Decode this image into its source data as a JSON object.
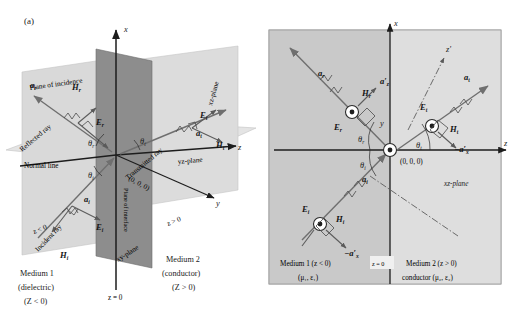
{
  "figure": {
    "caption_a": "(a)",
    "caption_b": "(b)"
  },
  "panel_a": {
    "axes": {
      "x": "x",
      "y": "y",
      "z": "z"
    },
    "planes": {
      "plane_of_incidence": "Plane of incidence",
      "xz_plane": "xz-plane",
      "yz_plane": "yz-plane",
      "xy_plane": "xy-plane",
      "plane_of_interface": "Plane of interface",
      "normal_line": "Normal line"
    },
    "rays": {
      "reflected": "Reflected ray",
      "transmitted": "Transmitted ray",
      "incident": "Incident ray"
    },
    "vectors": {
      "a_r": "a",
      "a_r_sub": "r",
      "a_t": "a",
      "a_t_sub": "t",
      "a_i": "a",
      "a_i_sub": "i",
      "E_r": "E",
      "E_r_sub": "r",
      "E_t": "E",
      "E_t_sub": "t",
      "E_i": "E",
      "E_i_sub": "i",
      "H_r": "H",
      "H_r_sub": "r",
      "H_t": "H",
      "H_t_sub": "t",
      "H_i": "H",
      "H_i_sub": "i"
    },
    "angles": {
      "theta_r": "θ",
      "theta_r_sub": "r",
      "theta_i": "θ",
      "theta_i_sub": "i",
      "theta_t": "θ",
      "theta_t_sub": "t"
    },
    "origin": "(0, 0, 0)",
    "regions": {
      "z_neg": "z < 0",
      "z_pos": "z > 0",
      "z_zero": "z = 0",
      "medium1_line1": "Medium 1",
      "medium1_line2": "(dielectric)",
      "medium1_line3": "(Z < 0)",
      "medium2_line1": "Medium 2",
      "medium2_line2": "(conductor)",
      "medium2_line3": "(Z > 0)"
    }
  },
  "panel_b": {
    "axes": {
      "x": "x",
      "y": "y",
      "z": "z",
      "z_prime": "z'"
    },
    "origin": "(0, 0, 0)",
    "plane_label": "xz-plane",
    "interface_label": "z = 0",
    "vectors": {
      "a_r": "a",
      "a_r_sub": "r",
      "a_t": "a",
      "a_t_sub": "t",
      "a_i": "a",
      "a_i_sub": "i",
      "E_r": "E",
      "E_r_sub": "r",
      "E_t": "E",
      "E_t_sub": "t",
      "E_i": "E",
      "E_i_sub": "i",
      "H_r": "H",
      "H_r_sub": "r",
      "H_t": "H",
      "H_t_sub": "t",
      "H_i": "H",
      "H_i_sub": "i",
      "a_prime_z": "a′",
      "a_prime_z_sub": "z",
      "neg_a_prime_x_top": "−a′",
      "neg_a_prime_x_top_sub": "x",
      "neg_a_prime_x_bot": "−a′",
      "neg_a_prime_x_bot_sub": "x"
    },
    "angles": {
      "theta_r": "θ",
      "theta_r_sub": "r",
      "theta_i": "θ",
      "theta_i_sub": "i",
      "theta_t": "θ",
      "theta_t_sub": "t"
    },
    "regions": {
      "medium1_line1": "Medium 1 (z < 0)",
      "medium1_line2": "(μ₁, ε₁)",
      "medium2_line1": "Medium 2 (z > 0)",
      "medium2_line2": "conductor (μ₂, ε₂)"
    }
  },
  "colors": {
    "background": "#ffffff",
    "medium1_fill": "#c9c9c9",
    "medium2_fill": "#dedede",
    "interface_plane": "#8f8f8f",
    "incidence_plane": "#d6d6d6",
    "ray": "#6f6f6f",
    "axis": "#1d1d1d",
    "text": "#1b1b1b"
  }
}
